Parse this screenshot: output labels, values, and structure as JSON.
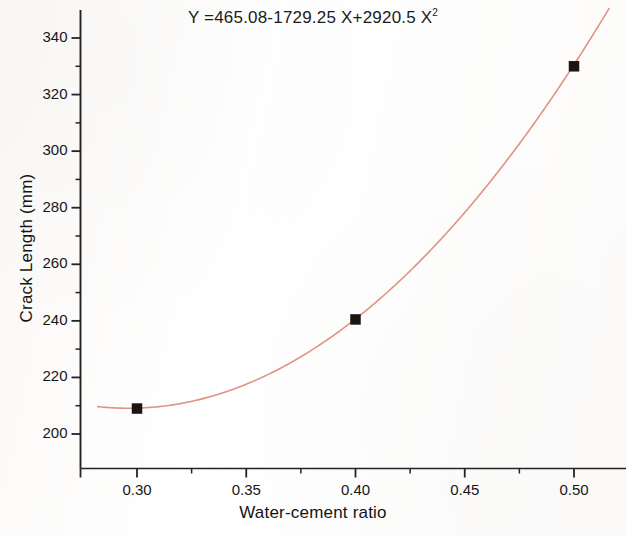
{
  "chart_data": {
    "type": "scatter",
    "title_base": "Y =465.08-1729.25 X+2920.5 X",
    "title_exponent": "2",
    "xlabel": "Water-cement ratio",
    "ylabel": "Crack Length (mm)",
    "xlim": [
      0.278,
      0.518
    ],
    "ylim": [
      193,
      347
    ],
    "xticks": [
      0.3,
      0.35,
      0.4,
      0.45,
      0.5
    ],
    "xtick_labels": [
      "0.30",
      "0.35",
      "0.40",
      "0.45",
      "0.50"
    ],
    "x_minor_ticks": [
      0.325,
      0.375,
      0.425,
      0.475
    ],
    "yticks": [
      200,
      220,
      240,
      260,
      280,
      300,
      320,
      340
    ],
    "ytick_labels": [
      "200",
      "220",
      "240",
      "260",
      "280",
      "300",
      "320",
      "340"
    ],
    "y_minor_ticks": [
      210,
      230,
      250,
      270,
      290,
      310,
      330
    ],
    "grid": false,
    "legend": false,
    "points": [
      {
        "x": 0.3,
        "y": 209.0
      },
      {
        "x": 0.4,
        "y": 240.5
      },
      {
        "x": 0.5,
        "y": 330.0
      }
    ],
    "series": [
      {
        "name": "Measured crack length",
        "type": "scatter",
        "marker": "filled-square",
        "color": "#1a1512",
        "x": [
          0.3,
          0.4,
          0.5
        ],
        "values": [
          209.0,
          240.5,
          330.0
        ]
      },
      {
        "name": "Quadratic fit",
        "type": "line",
        "color": "#e09285",
        "equation": "Y =465.08-1729.25 X+2920.5 X²",
        "coefficients": {
          "intercept": 465.08,
          "linear": -1729.25,
          "quadratic": 2920.5
        }
      }
    ],
    "fit_curve": {
      "intercept": 465.08,
      "linear": -1729.25,
      "quadratic": 2920.5,
      "x_start": 0.282,
      "x_end": 0.516,
      "color": "#e09285",
      "width": 1.6
    },
    "axis_color": "#232323",
    "marker_color": "#1a1512",
    "background": "#fdfcfb"
  }
}
